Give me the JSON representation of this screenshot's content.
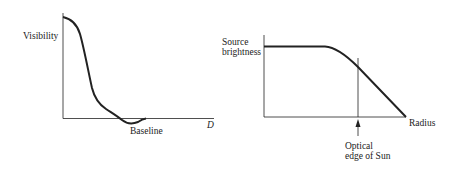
{
  "left_plot": {
    "ylabel": "Visibility",
    "xlabel": "D",
    "annotation": "Baseline"
  },
  "right_plot": {
    "ylabel_line1": "Source",
    "ylabel_line2": "brightness",
    "xlabel": "Radius",
    "annotation_line1": "Optical",
    "annotation_line2": "edge of Sun"
  },
  "colors": {
    "ink": "#222222",
    "background": "#ffffff"
  }
}
